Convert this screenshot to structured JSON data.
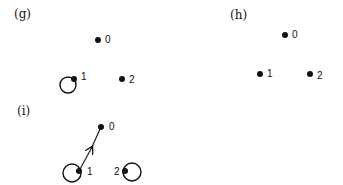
{
  "panels": [
    {
      "id": "g",
      "label": "(g)",
      "nodes": [
        {
          "id": "0",
          "label": "0",
          "x": 98,
          "y": 40,
          "self_loop": false
        },
        {
          "id": "1",
          "label": "1",
          "x": 74,
          "y": 79,
          "self_loop": true
        },
        {
          "id": "2",
          "label": "2",
          "x": 122,
          "y": 79,
          "self_loop": false
        }
      ],
      "edges": []
    },
    {
      "id": "h",
      "label": "(h)",
      "nodes": [
        {
          "id": "0",
          "label": "0",
          "x": 285,
          "y": 35,
          "self_loop": false
        },
        {
          "id": "1",
          "label": "1",
          "x": 260,
          "y": 74,
          "self_loop": false
        },
        {
          "id": "2",
          "label": "2",
          "x": 310,
          "y": 74,
          "self_loop": false
        }
      ],
      "edges": []
    },
    {
      "id": "i",
      "label": "(i)",
      "nodes": [
        {
          "id": "0",
          "label": "0",
          "x": 101,
          "y": 127,
          "self_loop": false
        },
        {
          "id": "1",
          "label": "1",
          "x": 79,
          "y": 171,
          "self_loop": true
        },
        {
          "id": "2",
          "label": "2",
          "x": 125,
          "y": 171,
          "self_loop": true
        }
      ],
      "edges": [
        {
          "from": "1",
          "to": "0",
          "directed": true
        }
      ]
    }
  ],
  "colors": {
    "ink": "#111111",
    "background": "#ffffff"
  }
}
